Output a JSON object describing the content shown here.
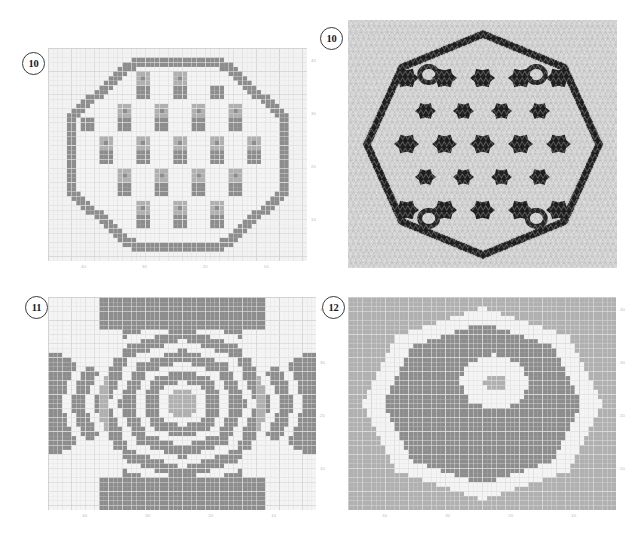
{
  "page": {
    "kind": "knitting-pattern-chart-sheet",
    "background": "#ffffff",
    "width": 641,
    "height": 538
  },
  "palette": {
    "grid_background": "#f2f2f2",
    "grid_line_minor": "#e0e0e0",
    "grid_line_major": "#cfcfcf",
    "color_light": "#f4f4f4",
    "color_mid": "#b0b0b0",
    "color_dark": "#8d8d8d",
    "tick_text": "#b9b9b9",
    "badge_border": "#3a3a3a",
    "badge_text": "#1a1a1a"
  },
  "panels": [
    {
      "id": "panel-10-chart",
      "badge": "10",
      "type": "chart",
      "caption": "",
      "axis": {
        "x_ticks": [
          "40",
          "30",
          "20",
          "10"
        ],
        "y_ticks": [
          "40",
          "30",
          "20",
          "10"
        ],
        "x_direction": "decreasing-left-to-right",
        "y_direction": "decreasing-top-to-bottom",
        "cols": 56,
        "rows": 46
      },
      "motif": "octagonal-medallion-with-cross-dots"
    },
    {
      "id": "panel-10-photo",
      "badge": "10",
      "type": "photo",
      "caption": "",
      "subject": "knitted-swatch-black-and-white-dotted-medallion"
    },
    {
      "id": "panel-11-chart",
      "badge": "11",
      "type": "chart",
      "caption": "",
      "axis": {
        "x_ticks": [
          "40",
          "30",
          "20",
          "10"
        ],
        "y_ticks": [
          "40",
          "30",
          "20",
          "10"
        ],
        "x_direction": "decreasing-left-to-right",
        "y_direction": "decreasing-top-to-bottom",
        "cols": 58,
        "rows": 46
      },
      "motif": "concentric-rings-with-corner-wedges"
    },
    {
      "id": "panel-12-chart",
      "badge": "12",
      "type": "chart",
      "caption": "",
      "axis": {
        "x_ticks": [
          "40",
          "30",
          "20",
          "10"
        ],
        "y_ticks": [
          "40",
          "30",
          "20",
          "10"
        ],
        "x_direction": "decreasing-left-to-right",
        "y_direction": "decreasing-top-to-bottom",
        "cols": 58,
        "rows": 46
      },
      "motif": "large-oval-with-offset-inner-oval"
    }
  ],
  "chart_data": [
    {
      "type": "heatmap",
      "id": "chart-10",
      "title": "10",
      "xlabel": "",
      "ylabel": "",
      "cols": 56,
      "rows": 46,
      "xlim": [
        44,
        -10
      ],
      "ylim": [
        44,
        -1
      ],
      "x_tick_values": [
        40,
        30,
        20,
        10
      ],
      "y_tick_values": [
        40,
        30,
        20,
        10
      ],
      "grid": true,
      "legend": "none",
      "value_colors": {
        "0": "#f4f4f4",
        "1": "#b0b0b0",
        "2": "#8d8d8d"
      },
      "description": "Octagonal medallion outlined in dark grey, filled with a lattice of dark grey plus-shaped dots and mid-grey square blocks on a light ground."
    },
    {
      "type": "heatmap",
      "id": "chart-11",
      "title": "11",
      "xlabel": "",
      "ylabel": "",
      "cols": 58,
      "rows": 46,
      "xlim": [
        44,
        -12
      ],
      "ylim": [
        44,
        -1
      ],
      "x_tick_values": [
        40,
        30,
        20,
        10
      ],
      "y_tick_values": [
        40,
        30,
        20,
        10
      ],
      "grid": true,
      "legend": "none",
      "value_colors": {
        "0": "#f4f4f4",
        "1": "#b0b0b0",
        "2": "#8d8d8d"
      },
      "description": "Concentric light rings radiating from a mid-grey centre square on a dark grey ground, with light diagonal wedges filling the four corners."
    },
    {
      "type": "heatmap",
      "id": "chart-12",
      "title": "12",
      "xlabel": "",
      "ylabel": "",
      "cols": 58,
      "rows": 46,
      "xlim": [
        44,
        -12
      ],
      "ylim": [
        44,
        -1
      ],
      "x_tick_values": [
        40,
        30,
        20,
        10
      ],
      "y_tick_values": [
        40,
        30,
        20,
        10
      ],
      "grid": true,
      "legend": "none",
      "value_colors": {
        "0": "#f4f4f4",
        "1": "#b0b0b0",
        "2": "#8d8d8d"
      },
      "description": "A large dark grey oval outlined by a thick light grey band, containing a smaller light grey oval whose own centre is a small dark grey oval."
    }
  ]
}
